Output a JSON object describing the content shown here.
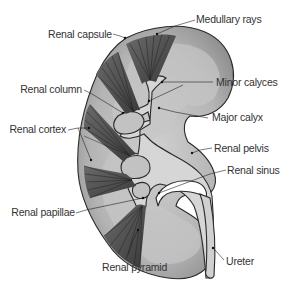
{
  "diagram": {
    "labels": {
      "renal_capsule": "Renal capsule",
      "medullary_rays": "Medullary rays",
      "renal_column": "Renal column",
      "minor_calyces": "Minor calyces",
      "major_calyx": "Major calyx",
      "renal_cortex": "Renal cortex",
      "renal_pelvis": "Renal pelvis",
      "renal_sinus": "Renal sinus",
      "renal_papillae": "Renal papillae",
      "renal_pyramid": "Renal pyramid",
      "ureter": "Ureter"
    },
    "colors": {
      "cortex": "#9a9a9a",
      "medulla_light": "#c8c8c8",
      "pelvis": "#d4d4d4",
      "pyramid": "#555555",
      "sinus": "#ffffff",
      "outline": "#2a2a2a",
      "text": "#333333"
    }
  }
}
